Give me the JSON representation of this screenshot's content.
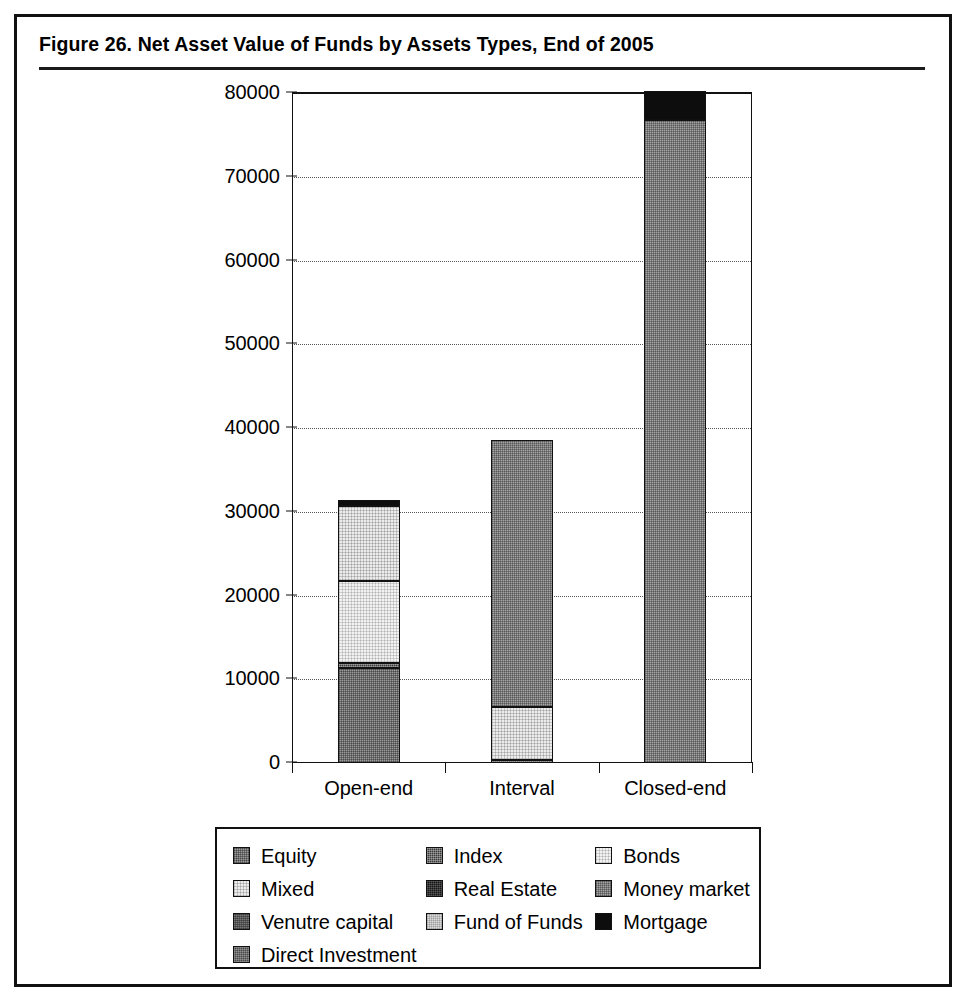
{
  "figure": {
    "title": "Figure 26.  Net Asset Value of Funds by Assets Types, End of 2005"
  },
  "chart_data": {
    "type": "bar",
    "subtype": "stacked",
    "title": "Figure 26.  Net Asset Value of Funds by Assets Types, End of 2005",
    "xlabel": "",
    "ylabel": "",
    "ylim": [
      0,
      80000
    ],
    "ytick_values": [
      0,
      10000,
      20000,
      30000,
      40000,
      50000,
      60000,
      70000,
      80000
    ],
    "ytick_labels": [
      "0",
      "10000",
      "20000",
      "30000",
      "40000",
      "50000",
      "60000",
      "70000",
      "80000"
    ],
    "grid": "horizontal-dotted",
    "legend_position": "bottom",
    "categories": [
      "Open-end",
      "Interval",
      "Closed-end"
    ],
    "series": [
      {
        "name": "Equity",
        "key": "equity",
        "pattern": "p-equity",
        "color": "#9b9b9b",
        "values": [
          11300,
          0,
          0
        ]
      },
      {
        "name": "Index",
        "key": "index",
        "pattern": "p-index",
        "color": "#3a3a3a",
        "values": [
          600,
          400,
          0
        ]
      },
      {
        "name": "Bonds",
        "key": "bonds",
        "pattern": "p-bonds",
        "color": "#f2f2f2",
        "values": [
          9800,
          0,
          0
        ]
      },
      {
        "name": "Mixed",
        "key": "mixed",
        "pattern": "p-mixed",
        "color": "#ececec",
        "values": [
          9000,
          6300,
          0
        ]
      },
      {
        "name": "Real Estate",
        "key": "real_estate",
        "pattern": "p-realestate",
        "color": "#161616",
        "values": [
          0,
          0,
          0
        ]
      },
      {
        "name": "Money market",
        "key": "money_market",
        "pattern": "p-moneymarket",
        "color": "#a3a3a3",
        "values": [
          0,
          31900,
          76800
        ]
      },
      {
        "name": "Venutre capital",
        "key": "venture",
        "pattern": "p-venture",
        "color": "#5c5c5c",
        "values": [
          0,
          0,
          0
        ]
      },
      {
        "name": "Fund of Funds",
        "key": "fund_of_funds",
        "pattern": "p-fundoffunds",
        "color": "#dcdcdc",
        "values": [
          0,
          0,
          0
        ]
      },
      {
        "name": "Mortgage",
        "key": "mortgage",
        "pattern": "p-mortgage",
        "color": "#0d0d0d",
        "values": [
          700,
          0,
          3500
        ]
      },
      {
        "name": "Direct Investment",
        "key": "direct",
        "pattern": "p-direct",
        "color": "#4a4a4a",
        "values": [
          0,
          0,
          0
        ]
      }
    ],
    "totals": [
      31400,
      38600,
      80300
    ]
  },
  "axis": {
    "y_ticks": [
      "80000",
      "70000",
      "60000",
      "50000",
      "40000",
      "30000",
      "20000",
      "10000",
      "0"
    ],
    "x_categories": [
      "Open-end",
      "Interval",
      "Closed-end"
    ]
  },
  "legend": {
    "rows": [
      [
        {
          "label": "Equity",
          "pattern": "p-equity"
        },
        {
          "label": "Index",
          "pattern": "p-index"
        },
        {
          "label": "Bonds",
          "pattern": "p-bonds"
        }
      ],
      [
        {
          "label": "Mixed",
          "pattern": "p-mixed"
        },
        {
          "label": "Real Estate",
          "pattern": "p-realestate"
        },
        {
          "label": "Money market",
          "pattern": "p-moneymarket"
        }
      ],
      [
        {
          "label": "Venutre capital",
          "pattern": "p-venture"
        },
        {
          "label": "Fund of Funds",
          "pattern": "p-fundoffunds"
        },
        {
          "label": "Mortgage",
          "pattern": "p-mortgage"
        }
      ],
      [
        {
          "label": "Direct Investment",
          "pattern": "p-direct"
        }
      ]
    ]
  }
}
